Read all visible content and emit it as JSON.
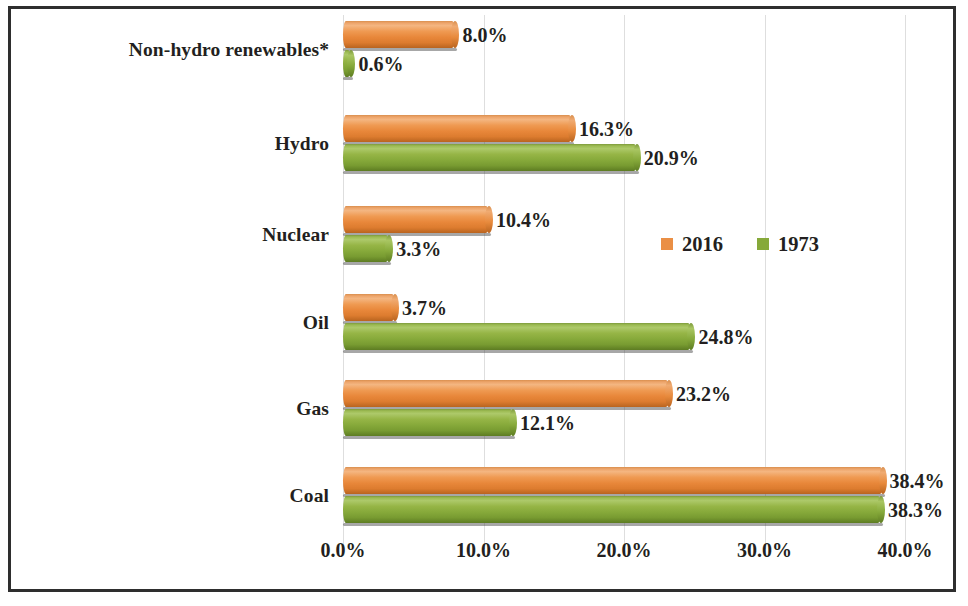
{
  "chart_data": {
    "type": "bar",
    "orientation": "horizontal",
    "title": "",
    "xlabel": "",
    "ylabel": "",
    "categories": [
      "Non-hydro renewables*",
      "Hydro",
      "Nuclear",
      "Oil",
      "Gas",
      "Coal"
    ],
    "series": [
      {
        "name": "2016",
        "color": "#ea8f45",
        "values": [
          8.0,
          16.3,
          10.4,
          3.7,
          23.2,
          38.4
        ],
        "labels": [
          "8.0%",
          "16.3%",
          "10.4%",
          "3.7%",
          "23.2%",
          "38.4%"
        ]
      },
      {
        "name": "1973",
        "color": "#86a93a",
        "values": [
          0.6,
          20.9,
          3.3,
          24.8,
          12.1,
          38.3
        ],
        "labels": [
          "0.6%",
          "20.9%",
          "3.3%",
          "24.8%",
          "12.1%",
          "38.3%"
        ]
      }
    ],
    "xlim": [
      0,
      45
    ],
    "xticks": [
      0,
      10,
      20,
      30,
      40
    ],
    "xtick_labels": [
      "0.0%",
      "10.0%",
      "20.0%",
      "30.0%",
      "40.0%"
    ],
    "grid": true,
    "grid_axis": "x",
    "legend_position": "middle-right",
    "legend_entries": [
      "2016",
      "1973"
    ],
    "value_labels_shown": true,
    "frame_color": "#2e2e2e"
  },
  "legend": {
    "items": [
      {
        "label": "2016",
        "color": "#ea8f45"
      },
      {
        "label": "1973",
        "color": "#86a93a"
      }
    ]
  },
  "axis": {
    "ticks": [
      {
        "label": "0.0%"
      },
      {
        "label": "10.0%"
      },
      {
        "label": "20.0%"
      },
      {
        "label": "30.0%"
      },
      {
        "label": "40.0%"
      }
    ]
  },
  "rows": [
    {
      "category": "Non-hydro renewables*",
      "series_2016": {
        "label": "8.0%"
      },
      "series_1973": {
        "label": "0.6%"
      }
    },
    {
      "category": "Hydro",
      "series_2016": {
        "label": "16.3%"
      },
      "series_1973": {
        "label": "20.9%"
      }
    },
    {
      "category": "Nuclear",
      "series_2016": {
        "label": "10.4%"
      },
      "series_1973": {
        "label": "3.3%"
      }
    },
    {
      "category": "Oil",
      "series_2016": {
        "label": "3.7%"
      },
      "series_1973": {
        "label": "24.8%"
      }
    },
    {
      "category": "Gas",
      "series_2016": {
        "label": "23.2%"
      },
      "series_1973": {
        "label": "12.1%"
      }
    },
    {
      "category": "Coal",
      "series_2016": {
        "label": "38.4%"
      },
      "series_1973": {
        "label": "38.3%"
      }
    }
  ]
}
